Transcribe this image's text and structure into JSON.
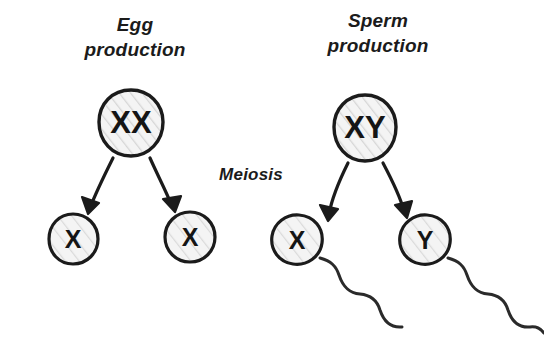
{
  "diagram": {
    "background_color": "#ffffff",
    "ink_color": "#1b1b1b",
    "cell_fill_color": "#f2f2f2",
    "hatch_color": "#d8d8d8"
  },
  "labels": {
    "egg": "Egg\nproduction",
    "sperm": "Sperm\nproduction",
    "meiosis": "Meiosis"
  },
  "parents": [
    {
      "id": "egg-parent",
      "genotype": "XX",
      "lineage": "egg",
      "shape": "circle"
    },
    {
      "id": "sperm-parent",
      "genotype": "XY",
      "lineage": "sperm",
      "shape": "circle"
    }
  ],
  "gametes": [
    {
      "id": "egg-gamete-left",
      "chromosome": "X",
      "lineage": "egg",
      "shape": "circle",
      "has_tail": false
    },
    {
      "id": "egg-gamete-right",
      "chromosome": "X",
      "lineage": "egg",
      "shape": "circle",
      "has_tail": false
    },
    {
      "id": "sperm-gamete-left",
      "chromosome": "X",
      "lineage": "sperm",
      "shape": "oval",
      "has_tail": true
    },
    {
      "id": "sperm-gamete-right",
      "chromosome": "Y",
      "lineage": "sperm",
      "shape": "oval",
      "has_tail": true
    }
  ],
  "arrows": [
    {
      "id": "arrow-egg-left",
      "from": "egg-parent",
      "to": "egg-gamete-left"
    },
    {
      "id": "arrow-egg-right",
      "from": "egg-parent",
      "to": "egg-gamete-right"
    },
    {
      "id": "arrow-sperm-left",
      "from": "sperm-parent",
      "to": "sperm-gamete-left"
    },
    {
      "id": "arrow-sperm-right",
      "from": "sperm-parent",
      "to": "sperm-gamete-right"
    }
  ]
}
